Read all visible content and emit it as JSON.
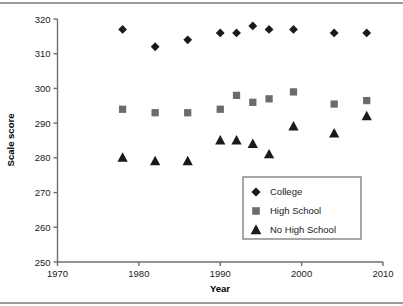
{
  "chart_data": {
    "type": "scatter",
    "title": "",
    "xlabel": "Year",
    "ylabel": "Scale score",
    "xlim": [
      1970,
      2010
    ],
    "ylim": [
      250,
      320
    ],
    "xticks": [
      1970,
      1980,
      1990,
      2000,
      2010
    ],
    "yticks": [
      250,
      260,
      270,
      280,
      290,
      300,
      310,
      320
    ],
    "grid": false,
    "legend_position": "inside-lower-right",
    "series": [
      {
        "name": "College",
        "marker": "diamond",
        "color": "#1a1a1a",
        "points": [
          {
            "x": 1978,
            "y": 317
          },
          {
            "x": 1982,
            "y": 312
          },
          {
            "x": 1986,
            "y": 314
          },
          {
            "x": 1990,
            "y": 316
          },
          {
            "x": 1992,
            "y": 316
          },
          {
            "x": 1994,
            "y": 318
          },
          {
            "x": 1996,
            "y": 317
          },
          {
            "x": 1999,
            "y": 317
          },
          {
            "x": 2004,
            "y": 316
          },
          {
            "x": 2008,
            "y": 316
          }
        ]
      },
      {
        "name": "High School",
        "marker": "square",
        "color": "#6b6b6b",
        "points": [
          {
            "x": 1978,
            "y": 294
          },
          {
            "x": 1982,
            "y": 293
          },
          {
            "x": 1986,
            "y": 293
          },
          {
            "x": 1990,
            "y": 294
          },
          {
            "x": 1992,
            "y": 298
          },
          {
            "x": 1994,
            "y": 296
          },
          {
            "x": 1996,
            "y": 297
          },
          {
            "x": 1999,
            "y": 299
          },
          {
            "x": 2004,
            "y": 295.5
          },
          {
            "x": 2008,
            "y": 296.5
          }
        ]
      },
      {
        "name": "No High School",
        "marker": "triangle",
        "color": "#1a1a1a",
        "points": [
          {
            "x": 1978,
            "y": 280
          },
          {
            "x": 1982,
            "y": 279
          },
          {
            "x": 1986,
            "y": 279
          },
          {
            "x": 1990,
            "y": 285
          },
          {
            "x": 1992,
            "y": 285
          },
          {
            "x": 1994,
            "y": 284
          },
          {
            "x": 1996,
            "y": 281
          },
          {
            "x": 1999,
            "y": 289
          },
          {
            "x": 2004,
            "y": 287
          },
          {
            "x": 2008,
            "y": 292
          }
        ]
      }
    ]
  },
  "axes": {
    "x_title": "Year",
    "y_title": "Scale score",
    "x_tick_labels": [
      "1970",
      "1980",
      "1990",
      "2000",
      "2010"
    ],
    "y_tick_labels": [
      "250",
      "260",
      "270",
      "280",
      "290",
      "300",
      "310",
      "320"
    ]
  },
  "legend": {
    "entries": [
      {
        "label": "College",
        "marker": "diamond",
        "color": "#1a1a1a"
      },
      {
        "label": "High School",
        "marker": "square",
        "color": "#6b6b6b"
      },
      {
        "label": "No High School",
        "marker": "triangle",
        "color": "#1a1a1a"
      }
    ]
  }
}
